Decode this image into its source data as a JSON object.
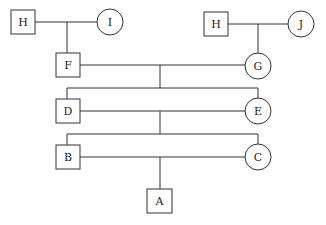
{
  "diagram": {
    "type": "pedigree",
    "nodes": [
      {
        "id": "H1",
        "label": "H",
        "shape": "square",
        "sex": "male"
      },
      {
        "id": "I",
        "label": "I",
        "shape": "circle",
        "sex": "female"
      },
      {
        "id": "H2",
        "label": "H",
        "shape": "square",
        "sex": "male"
      },
      {
        "id": "J",
        "label": "J",
        "shape": "circle",
        "sex": "female"
      },
      {
        "id": "F",
        "label": "F",
        "shape": "square",
        "sex": "male"
      },
      {
        "id": "G",
        "label": "G",
        "shape": "circle",
        "sex": "female"
      },
      {
        "id": "D",
        "label": "D",
        "shape": "square",
        "sex": "male"
      },
      {
        "id": "E",
        "label": "E",
        "shape": "circle",
        "sex": "female"
      },
      {
        "id": "B",
        "label": "B",
        "shape": "square",
        "sex": "male"
      },
      {
        "id": "C",
        "label": "C",
        "shape": "circle",
        "sex": "female"
      },
      {
        "id": "A",
        "label": "A",
        "shape": "square",
        "sex": "male"
      }
    ],
    "matings": [
      {
        "parents": [
          "H1",
          "I"
        ],
        "children": [
          "F"
        ]
      },
      {
        "parents": [
          "H2",
          "J"
        ],
        "children": [
          "G"
        ]
      },
      {
        "parents": [
          "F",
          "G"
        ],
        "children": [
          "D",
          "E"
        ]
      },
      {
        "parents": [
          "D",
          "E"
        ],
        "children": [
          "B",
          "C"
        ]
      },
      {
        "parents": [
          "B",
          "C"
        ],
        "children": [
          "A"
        ]
      }
    ]
  }
}
